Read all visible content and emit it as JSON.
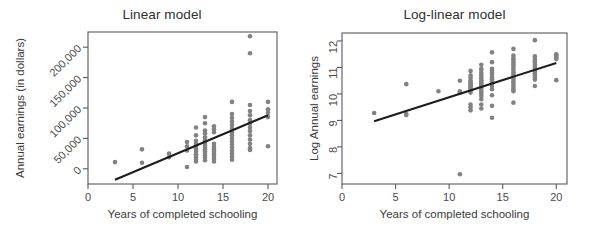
{
  "figure": {
    "background": "#ffffff",
    "point_color": "#828282",
    "line_color": "#1c1c1c",
    "axis_color": "#5a5a5a"
  },
  "chart_data": [
    {
      "type": "scatter",
      "panel": "left",
      "title": "Linear model",
      "xlabel": "Years of completed schooling",
      "ylabel": "Annual earnings (in dollars)",
      "xlim": [
        0,
        21
      ],
      "ylim": [
        -25000,
        225000
      ],
      "xticks": [
        0,
        5,
        10,
        15,
        20
      ],
      "xtick_labels": [
        "0",
        "5",
        "10",
        "15",
        "20"
      ],
      "yticks": [
        0,
        50000,
        100000,
        150000,
        200000
      ],
      "ytick_labels": [
        "0",
        "50,000",
        "100,000",
        "150,000",
        "200,000"
      ],
      "ytick_label_rotation": -45,
      "grid": false,
      "legend": false,
      "fit_line": {
        "x": [
          3,
          20
        ],
        "y": [
          -18000,
          88000
        ],
        "slope": 6235,
        "intercept": -36706
      },
      "points": [
        [
          3,
          11000
        ],
        [
          6,
          32000
        ],
        [
          6,
          10000
        ],
        [
          9,
          25000
        ],
        [
          9,
          19000
        ],
        [
          11,
          44000
        ],
        [
          11,
          37000
        ],
        [
          11,
          30000
        ],
        [
          11,
          3000
        ],
        [
          12,
          68000
        ],
        [
          12,
          55000
        ],
        [
          12,
          46000
        ],
        [
          12,
          41000
        ],
        [
          12,
          38000
        ],
        [
          12,
          34000
        ],
        [
          12,
          31000
        ],
        [
          12,
          28000
        ],
        [
          12,
          24000
        ],
        [
          12,
          21000
        ],
        [
          12,
          18000
        ],
        [
          12,
          15000
        ],
        [
          12,
          12000
        ],
        [
          13,
          85000
        ],
        [
          13,
          75000
        ],
        [
          13,
          63000
        ],
        [
          13,
          58000
        ],
        [
          13,
          52000
        ],
        [
          13,
          47000
        ],
        [
          13,
          43000
        ],
        [
          13,
          39000
        ],
        [
          13,
          35000
        ],
        [
          13,
          32000
        ],
        [
          13,
          29000
        ],
        [
          13,
          26000
        ],
        [
          13,
          22000
        ],
        [
          13,
          18000
        ],
        [
          13,
          14000
        ],
        [
          14,
          70000
        ],
        [
          14,
          65000
        ],
        [
          14,
          60000
        ],
        [
          14,
          41000
        ],
        [
          14,
          36000
        ],
        [
          14,
          32000
        ],
        [
          14,
          28000
        ],
        [
          14,
          24000
        ],
        [
          14,
          20000
        ],
        [
          14,
          16000
        ],
        [
          14,
          12000
        ],
        [
          16,
          110000
        ],
        [
          16,
          90000
        ],
        [
          16,
          84000
        ],
        [
          16,
          78000
        ],
        [
          16,
          72000
        ],
        [
          16,
          66000
        ],
        [
          16,
          60000
        ],
        [
          16,
          55000
        ],
        [
          16,
          50000
        ],
        [
          16,
          45000
        ],
        [
          16,
          40000
        ],
        [
          16,
          35000
        ],
        [
          16,
          30000
        ],
        [
          16,
          25000
        ],
        [
          16,
          20000
        ],
        [
          16,
          15000
        ],
        [
          18,
          190000
        ],
        [
          18,
          105000
        ],
        [
          18,
          95000
        ],
        [
          18,
          88000
        ],
        [
          18,
          80000
        ],
        [
          18,
          74000
        ],
        [
          18,
          68000
        ],
        [
          18,
          62000
        ],
        [
          18,
          55000
        ],
        [
          18,
          48000
        ],
        [
          18,
          41000
        ],
        [
          18,
          34000
        ],
        [
          18,
          31000
        ],
        [
          18,
          218000
        ],
        [
          20,
          110000
        ],
        [
          20,
          98000
        ],
        [
          20,
          92000
        ],
        [
          20,
          85000
        ],
        [
          20,
          37000
        ]
      ]
    },
    {
      "type": "scatter",
      "panel": "right",
      "title": "Log-linear model",
      "xlabel": "Years of completed schooling",
      "ylabel": "Log Annual earnings",
      "xlim": [
        0,
        21
      ],
      "ylim": [
        6.6,
        12.3
      ],
      "xticks": [
        0,
        5,
        10,
        15,
        20
      ],
      "xtick_labels": [
        "0",
        "5",
        "10",
        "15",
        "20"
      ],
      "yticks": [
        7,
        8,
        9,
        10,
        11,
        12
      ],
      "ytick_labels": [
        "7",
        "8",
        "9",
        "10",
        "11",
        "12"
      ],
      "ytick_label_rotation": -90,
      "grid": false,
      "legend": false,
      "fit_line": {
        "x": [
          3,
          20
        ],
        "y": [
          8.97,
          11.17
        ],
        "slope": 0.129,
        "intercept": 8.58
      },
      "points": [
        [
          3,
          9.28
        ],
        [
          6,
          10.37
        ],
        [
          6,
          9.24
        ],
        [
          6,
          9.2
        ],
        [
          9,
          10.1
        ],
        [
          11,
          10.5
        ],
        [
          11,
          10.1
        ],
        [
          11,
          10.04
        ],
        [
          11,
          6.97
        ],
        [
          12,
          10.87
        ],
        [
          12,
          10.7
        ],
        [
          12,
          10.6
        ],
        [
          12,
          10.5
        ],
        [
          12,
          10.45
        ],
        [
          12,
          10.4
        ],
        [
          12,
          10.35
        ],
        [
          12,
          10.3
        ],
        [
          12,
          10.25
        ],
        [
          12,
          10.2
        ],
        [
          12,
          10.12
        ],
        [
          12,
          10.05
        ],
        [
          12,
          9.6
        ],
        [
          12,
          9.5
        ],
        [
          12,
          9.38
        ],
        [
          13,
          11.1
        ],
        [
          13,
          10.95
        ],
        [
          13,
          10.9
        ],
        [
          13,
          10.8
        ],
        [
          13,
          10.72
        ],
        [
          13,
          10.65
        ],
        [
          13,
          10.58
        ],
        [
          13,
          10.52
        ],
        [
          13,
          10.46
        ],
        [
          13,
          10.4
        ],
        [
          13,
          10.34
        ],
        [
          13,
          10.28
        ],
        [
          13,
          10.22
        ],
        [
          13,
          10.15
        ],
        [
          13,
          10.08
        ],
        [
          13,
          10.0
        ],
        [
          13,
          9.92
        ],
        [
          13,
          9.8
        ],
        [
          13,
          9.6
        ],
        [
          13,
          9.45
        ],
        [
          14,
          11.57
        ],
        [
          14,
          11.2
        ],
        [
          14,
          10.95
        ],
        [
          14,
          10.88
        ],
        [
          14,
          10.8
        ],
        [
          14,
          10.72
        ],
        [
          14,
          10.64
        ],
        [
          14,
          10.55
        ],
        [
          14,
          10.48
        ],
        [
          14,
          10.4
        ],
        [
          14,
          10.3
        ],
        [
          14,
          10.18
        ],
        [
          14,
          9.95
        ],
        [
          14,
          9.55
        ],
        [
          14,
          9.1
        ],
        [
          16,
          11.7
        ],
        [
          16,
          11.45
        ],
        [
          16,
          11.35
        ],
        [
          16,
          11.28
        ],
        [
          16,
          11.2
        ],
        [
          16,
          11.12
        ],
        [
          16,
          11.05
        ],
        [
          16,
          10.98
        ],
        [
          16,
          10.9
        ],
        [
          16,
          10.82
        ],
        [
          16,
          10.74
        ],
        [
          16,
          10.66
        ],
        [
          16,
          10.58
        ],
        [
          16,
          10.5
        ],
        [
          16,
          10.42
        ],
        [
          16,
          10.34
        ],
        [
          16,
          10.26
        ],
        [
          16,
          10.18
        ],
        [
          16,
          10.1
        ],
        [
          16,
          9.67
        ],
        [
          18,
          12.03
        ],
        [
          18,
          11.42
        ],
        [
          18,
          11.32
        ],
        [
          18,
          11.25
        ],
        [
          18,
          11.18
        ],
        [
          18,
          11.1
        ],
        [
          18,
          11.02
        ],
        [
          18,
          10.94
        ],
        [
          18,
          10.86
        ],
        [
          18,
          10.78
        ],
        [
          18,
          10.7
        ],
        [
          18,
          10.62
        ],
        [
          18,
          10.54
        ],
        [
          18,
          10.3
        ],
        [
          20,
          11.5
        ],
        [
          20,
          11.45
        ],
        [
          20,
          11.38
        ],
        [
          20,
          11.32
        ],
        [
          20,
          10.52
        ]
      ]
    }
  ]
}
